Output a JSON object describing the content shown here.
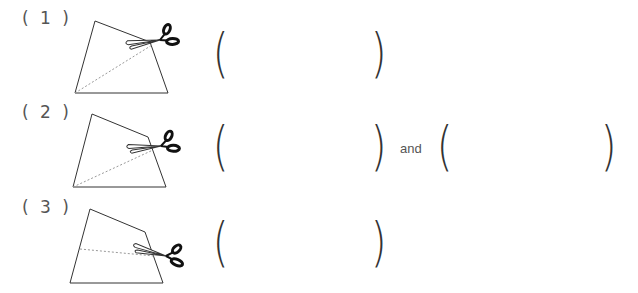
{
  "problems": [
    {
      "label": "( 1 )",
      "answers": [
        {
          "open": "(",
          "close": ")",
          "value": ""
        }
      ]
    },
    {
      "label": "( 2 )",
      "answers": [
        {
          "open": "(",
          "close": ")",
          "value": ""
        },
        {
          "open": "(",
          "close": ")",
          "value": ""
        }
      ],
      "connector": "and"
    },
    {
      "label": "( 3 )",
      "answers": [
        {
          "open": "(",
          "close": ")",
          "value": ""
        }
      ]
    }
  ],
  "icons": {
    "scissors": "scissors-icon"
  },
  "colors": {
    "line": "#333333",
    "cut_line": "#999999"
  }
}
